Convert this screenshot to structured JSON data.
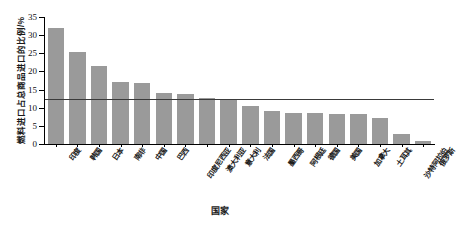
{
  "chart_data": {
    "type": "bar",
    "title": "",
    "subtitle": "",
    "xlabel": "国家",
    "ylabel": "燃料进口占总商品进口的比例/%",
    "categories": [
      "印度",
      "韩国",
      "日本",
      "南非",
      "中国",
      "巴西",
      "印度尼西亚",
      "澳大利亚",
      "意大利",
      "法国",
      "墨西哥",
      "阿根廷",
      "德国",
      "美国",
      "加拿大",
      "土耳其",
      "沙特阿拉伯",
      "俄罗斯"
    ],
    "values": [
      31.9,
      25.3,
      21.6,
      17.0,
      16.7,
      14.1,
      13.8,
      12.6,
      12.5,
      10.4,
      9.0,
      8.6,
      8.6,
      8.3,
      8.2,
      7.2,
      2.8,
      0.9
    ],
    "series": [
      {
        "name": "燃料进口占总商品进口的比例",
        "values": [
          31.9,
          25.3,
          21.6,
          17.0,
          16.7,
          14.1,
          13.8,
          12.6,
          12.5,
          10.4,
          9.0,
          8.6,
          8.6,
          8.3,
          8.2,
          7.2,
          2.8,
          0.9
        ]
      }
    ],
    "ylim": [
      0,
      35
    ],
    "yticks": [
      0,
      5,
      10,
      15,
      20,
      25,
      30,
      35
    ],
    "ytick_labels": [
      "0",
      "5",
      "10",
      "15",
      "20",
      "25",
      "30",
      "35"
    ],
    "grid": false,
    "legend": false,
    "annotations": [
      {
        "kind": "horizontal-reference-line",
        "value": 12.3,
        "label": ""
      }
    ],
    "colors": {
      "bar": "#9a9a9a",
      "reference_line": "#3a3a3a",
      "axis": "#000000",
      "text": "#1a1a1a",
      "background": "#ffffff"
    }
  }
}
